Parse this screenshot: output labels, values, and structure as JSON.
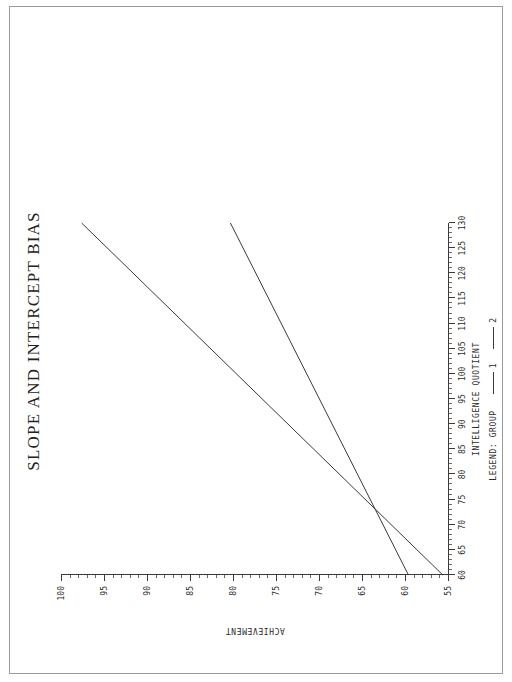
{
  "document": {
    "page_background": "#ffffff",
    "border_color": "#9a9a9a"
  },
  "chart": {
    "title": "SLOPE AND INTERCEPT BIAS",
    "x_axis_title": "INTELLIGENCE QUOTIENT",
    "y_axis_title": "ACHIEVEMENT",
    "legend_title": "LEGEND: GROUP",
    "line_color": "#3a3a3a"
  },
  "legend": {
    "entries": [
      {
        "label": "1",
        "color": "#3a3a3a"
      },
      {
        "label": "2",
        "color": "#3a3a3a"
      }
    ]
  },
  "chart_data": {
    "type": "line",
    "title": "SLOPE AND INTERCEPT BIAS",
    "xlabel": "INTELLIGENCE QUOTIENT",
    "ylabel": "ACHIEVEMENT",
    "xlim": [
      60,
      130
    ],
    "ylim": [
      55,
      100
    ],
    "xticks": [
      60,
      65,
      70,
      75,
      80,
      85,
      90,
      95,
      100,
      105,
      110,
      115,
      120,
      125,
      130
    ],
    "yticks": [
      55,
      60,
      65,
      70,
      75,
      80,
      85,
      90,
      95,
      100
    ],
    "xtick_labels": [
      "60",
      "65",
      "70",
      "75",
      "80",
      "85",
      "90",
      "95",
      "100",
      "105",
      "110",
      "115",
      "120",
      "125",
      "130"
    ],
    "ytick_labels": [
      "55",
      "60",
      "65",
      "70",
      "75",
      "80",
      "85",
      "90",
      "95",
      "100"
    ],
    "minor_tick_interval": 1,
    "grid": false,
    "legend_position": "below-axis",
    "series": [
      {
        "name": "1",
        "color": "#3a3a3a",
        "x": [
          60,
          130
        ],
        "y": [
          55.6,
          97.6
        ],
        "intercept": 19.6,
        "slope": 0.6
      },
      {
        "name": "2",
        "color": "#3a3a3a",
        "x": [
          60,
          130
        ],
        "y": [
          59.6,
          80.3
        ],
        "intercept": 41.85,
        "slope": 0.2957
      }
    ],
    "annotations": [
      {
        "text": "Lines intersect near IQ = 68",
        "x": 68,
        "y": 60.4
      }
    ]
  }
}
